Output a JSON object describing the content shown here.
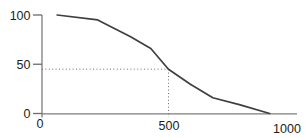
{
  "chart_data": {
    "type": "line",
    "xlim": [
      0,
      1000
    ],
    "ylim": [
      0,
      100
    ],
    "x_ticks": [
      {
        "value": 0,
        "label": "0"
      },
      {
        "value": 500,
        "label": "500"
      },
      {
        "value": 1000,
        "label": "1000"
      }
    ],
    "y_ticks": [
      {
        "value": 0,
        "label": "0"
      },
      {
        "value": 50,
        "label": "50"
      },
      {
        "value": 100,
        "label": "100"
      }
    ],
    "series": [
      {
        "name": "declining-curve",
        "color": "#3f3f3f",
        "points": [
          [
            60,
            100
          ],
          [
            220,
            95
          ],
          [
            350,
            78
          ],
          [
            430,
            66
          ],
          [
            500,
            45
          ],
          [
            585,
            30
          ],
          [
            675,
            16
          ],
          [
            780,
            9
          ],
          [
            900,
            0
          ]
        ]
      }
    ],
    "reference_point": {
      "x": 500,
      "y": 45,
      "style": "dotted",
      "description": "dotted guide lines from y-axis at 45 to curve, then down to x-axis at 500"
    },
    "grid": false,
    "legend": false,
    "colors": {
      "axis": "#7d7d7d",
      "tick": "#6b6b6b",
      "dotted_guide": "#6e6e6e",
      "tick_label": "#1c1c1c",
      "background": "#ffffff"
    }
  }
}
